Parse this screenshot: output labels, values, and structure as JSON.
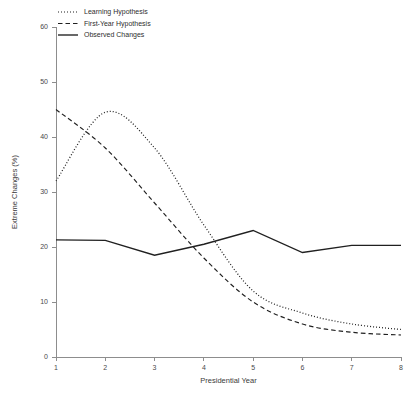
{
  "chart_data": {
    "type": "line",
    "title": "",
    "xlabel": "Presidential Year",
    "ylabel": "Extreme Changes (%)",
    "x": [
      1,
      2,
      3,
      4,
      5,
      6,
      7,
      8
    ],
    "xlim": [
      1,
      8
    ],
    "ylim": [
      0,
      60
    ],
    "xticks": [
      "1",
      "2",
      "3",
      "4",
      "5",
      "6",
      "7",
      "8"
    ],
    "yticks": [
      "0",
      "10",
      "20",
      "30",
      "40",
      "50",
      "60"
    ],
    "grid": false,
    "legend_position": "top-left",
    "series": [
      {
        "name": "Learning Hypothesis",
        "style": "dotted",
        "color": "#202020",
        "values": [
          32.0,
          44.5,
          38.0,
          24.0,
          12.0,
          8.0,
          6.0,
          5.0
        ]
      },
      {
        "name": "First-Year Hypothesis",
        "style": "dashed",
        "color": "#202020",
        "values": [
          45.0,
          38.0,
          28.0,
          18.0,
          10.0,
          6.0,
          4.5,
          4.0
        ]
      },
      {
        "name": "Observed Changes",
        "style": "solid",
        "color": "#202020",
        "values": [
          21.3,
          21.2,
          18.5,
          20.5,
          23.0,
          19.0,
          20.3,
          20.3
        ]
      }
    ]
  },
  "legend": {
    "entries": [
      {
        "label": "Learning Hypothesis"
      },
      {
        "label": "First-Year Hypothesis"
      },
      {
        "label": "Observed Changes"
      }
    ]
  }
}
